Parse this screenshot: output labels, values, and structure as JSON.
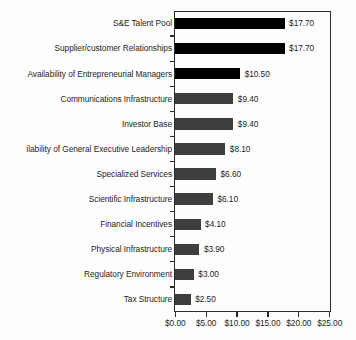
{
  "chart_data": {
    "type": "bar",
    "orientation": "horizontal",
    "title": "",
    "subtitle": "",
    "xlabel": "",
    "ylabel": "",
    "xlim": [
      0,
      25
    ],
    "xtick_values": [
      0,
      5,
      10,
      15,
      20,
      25
    ],
    "xtick_labels": [
      "$0.00",
      "$5.00",
      "$10.00",
      "$15.00",
      "$20.00",
      "$25.00"
    ],
    "grid": false,
    "legend": "none",
    "value_prefix": "$",
    "categories": [
      "S&E Talent Pool",
      "Supplier/customer Relationships",
      "Availability of Entrepreneurial Managers",
      "Communications Infrastructure",
      "Investor Base",
      "ilability of General Executive Leadership",
      "Specialized Services",
      "Scientific Infrastructure",
      "Financial Incentives",
      "Physical Infrastructure",
      "Regulatory Environment",
      "Tax Structure"
    ],
    "values": [
      17.7,
      17.7,
      10.5,
      9.4,
      9.4,
      8.1,
      6.6,
      6.1,
      4.1,
      3.9,
      3.0,
      2.5
    ],
    "value_labels": [
      "$17.70",
      "$17.70",
      "$10.50",
      "$9.40",
      "$9.40",
      "$8.10",
      "$6.60",
      "$6.10",
      "$4.10",
      "$3.90",
      "$3.00",
      "$2.50"
    ],
    "bar_colors": [
      "#000000",
      "#000000",
      "#000000",
      "#3e3e3e",
      "#3e3e3e",
      "#3e3e3e",
      "#3e3e3e",
      "#3e3e3e",
      "#3e3e3e",
      "#3e3e3e",
      "#3e3e3e",
      "#3e3e3e"
    ],
    "notes": {
      "clipped_label_index": 5,
      "clipped_label_full": "Availability of General Executive Leadership",
      "axis_color": "#2b2b2b",
      "text_color": "#1d1d1d",
      "background_color": "#fdfdfd"
    }
  }
}
